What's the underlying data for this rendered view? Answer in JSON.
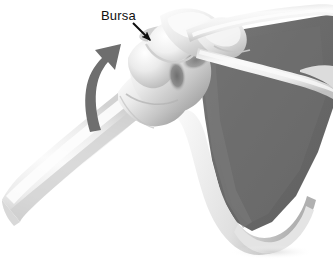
{
  "figure": {
    "background_color": "#ffffff",
    "width": 333,
    "height": 259
  },
  "labels": [
    {
      "id": "bursa",
      "text": "Bursa",
      "color": "#101010",
      "x": 101,
      "y": 9
    }
  ],
  "pointers": [
    {
      "id": "bursa-pointer",
      "name": "bursa-pointer-arrow",
      "color": "#0d0d0d",
      "from": {
        "x": 133,
        "y": 23
      },
      "to": {
        "x": 150,
        "y": 40
      }
    }
  ],
  "motion_arrows": [
    {
      "id": "abduction-arrow",
      "name": "abduction-motion-arrow",
      "color": "#6e6e6e",
      "direction": "upward-curving",
      "description": "Curved arrow indicating upward abduction of the humerus"
    }
  ],
  "anatomy": {
    "bone_light": "#f2f2f2",
    "bone_mid": "#d6d6d6",
    "bone_shadow": "#a8a8a8",
    "bone_dark_shadow": "#7e7e7e",
    "scapula_fill": "#6a6a6a",
    "scapula_edge": "#565656",
    "outline": "#bdbdbd",
    "parts": [
      {
        "id": "humerus-shaft",
        "name": "humerus-shaft"
      },
      {
        "id": "humeral-head",
        "name": "humeral-head"
      },
      {
        "id": "greater-tubercle",
        "name": "greater-tubercle"
      },
      {
        "id": "bicipital-groove",
        "name": "bicipital-groove"
      },
      {
        "id": "bursa-structure",
        "name": "subacromial-bursa"
      },
      {
        "id": "acromion",
        "name": "acromion-process"
      },
      {
        "id": "clavicle",
        "name": "clavicle"
      },
      {
        "id": "coracoid",
        "name": "coracoid-process"
      },
      {
        "id": "scapula-body",
        "name": "scapula-body"
      },
      {
        "id": "scapula-spine",
        "name": "scapula-spine"
      },
      {
        "id": "lateral-border",
        "name": "scapula-lateral-border"
      },
      {
        "id": "inferior-angle",
        "name": "scapula-inferior-angle"
      }
    ]
  }
}
